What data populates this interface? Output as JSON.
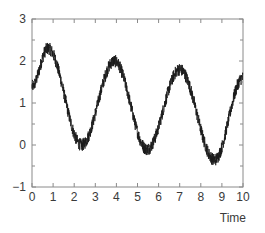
{
  "chart_data": {
    "type": "line",
    "title": "",
    "xlabel": "Time",
    "ylabel": "",
    "xlim": [
      0,
      10
    ],
    "ylim": [
      -1,
      3
    ],
    "grid": false,
    "legend": "none",
    "x_ticks": [
      0,
      1,
      2,
      3,
      4,
      5,
      6,
      7,
      8,
      9,
      10
    ],
    "x_tick_labels": [
      "0",
      "1",
      "2",
      "3",
      "4",
      "5",
      "6",
      "7",
      "8",
      "9",
      "10"
    ],
    "y_ticks": [
      -1,
      0,
      1,
      2,
      3
    ],
    "y_tick_labels": [
      "−1",
      "0",
      "1",
      "2",
      "3"
    ],
    "y_minor_ticks": [
      -0.5,
      0.5,
      1.5,
      2.5
    ],
    "series": [
      {
        "name": "noisy oscillation",
        "description": "Noisy sinusoid with slowly decreasing baseline; period about 3.1 time units",
        "color": "#1a1a1a",
        "anchor_points": {
          "x": [
            0,
            0.75,
            2.35,
            3.9,
            5.45,
            7.0,
            8.65,
            10
          ],
          "y": [
            1.4,
            2.3,
            0.0,
            2.0,
            -0.1,
            1.8,
            -0.35,
            1.6
          ]
        },
        "noise_amplitude": 0.15
      }
    ]
  }
}
